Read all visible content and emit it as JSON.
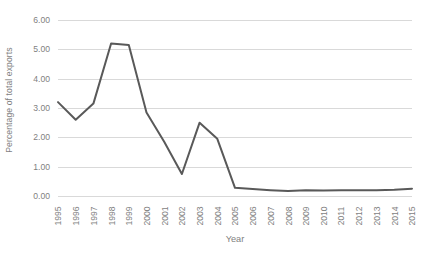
{
  "chart_data": {
    "type": "line",
    "title": "",
    "subtitle": "",
    "xlabel": "Year",
    "ylabel": "Percentage of total exports",
    "x": [
      1995,
      1996,
      1997,
      1998,
      1999,
      2000,
      2001,
      2002,
      2003,
      2004,
      2005,
      2006,
      2007,
      2008,
      2009,
      2010,
      2011,
      2012,
      2013,
      2014,
      2015
    ],
    "categories": [
      "1995",
      "1996",
      "1997",
      "1998",
      "1999",
      "2000",
      "2001",
      "2002",
      "2003",
      "2004",
      "2005",
      "2006",
      "2007",
      "2008",
      "2009",
      "2010",
      "2011",
      "2012",
      "2013",
      "2014",
      "2015"
    ],
    "values": [
      3.2,
      2.6,
      3.15,
      5.2,
      5.15,
      2.85,
      1.85,
      0.75,
      2.5,
      1.95,
      0.28,
      0.24,
      0.2,
      0.17,
      0.2,
      0.19,
      0.2,
      0.2,
      0.2,
      0.21,
      0.25
    ],
    "series": [
      {
        "name": "Percentage of total exports",
        "color": "#595959",
        "values": [
          3.2,
          2.6,
          3.15,
          5.2,
          5.15,
          2.85,
          1.85,
          0.75,
          2.5,
          1.95,
          0.28,
          0.24,
          0.2,
          0.17,
          0.2,
          0.19,
          0.2,
          0.2,
          0.2,
          0.21,
          0.25
        ]
      }
    ],
    "ylim": [
      0,
      6
    ],
    "ytick_step": 1,
    "ytick_labels": [
      "0.00",
      "1.00",
      "2.00",
      "3.00",
      "4.00",
      "5.00",
      "6.00"
    ],
    "ytick_values": [
      0,
      1,
      2,
      3,
      4,
      5,
      6
    ],
    "xlim": [
      1995,
      2015
    ],
    "grid": {
      "horizontal": true,
      "vertical": false,
      "color": "#d9d9d9"
    },
    "legend": {
      "visible": false,
      "position": "none"
    },
    "markers": false,
    "line_width": 2,
    "background": "#ffffff",
    "text_color": "#7f7f7f"
  }
}
